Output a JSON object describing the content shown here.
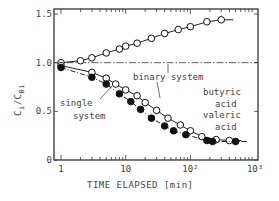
{
  "chart_data": {
    "type": "scatter",
    "title": "",
    "xlabel": "TIME ELAPSED  [min]",
    "ylabel": "C_i/C_0i",
    "xscale": "log",
    "xlim": [
      0.8,
      1000
    ],
    "ylim": [
      0,
      1.5
    ],
    "x_ticks": [
      "1",
      "10",
      "10²",
      "10³"
    ],
    "y_ticks": [
      "0",
      "0.5",
      "1.0",
      "1.5"
    ],
    "grid": false,
    "reference_line": {
      "y": 1.0,
      "style": "dash-dot",
      "label": "binary system"
    },
    "annotations": [
      "butyric acid",
      "binary system",
      "single system",
      "valeric acid"
    ],
    "series": [
      {
        "name": "butyric acid (binary system)",
        "marker": "open-circle",
        "x": [
          1,
          2,
          3,
          5,
          8,
          10,
          15,
          25,
          40,
          65,
          100,
          180,
          300
        ],
        "y": [
          1.0,
          1.02,
          1.05,
          1.1,
          1.14,
          1.17,
          1.2,
          1.25,
          1.3,
          1.34,
          1.37,
          1.42,
          1.44
        ]
      },
      {
        "name": "valeric acid (binary system)",
        "marker": "open-circle",
        "x": [
          1,
          3,
          5,
          7,
          10,
          15,
          20,
          30,
          45,
          70,
          100,
          150,
          250,
          400
        ],
        "y": [
          0.97,
          0.9,
          0.84,
          0.78,
          0.72,
          0.66,
          0.59,
          0.51,
          0.43,
          0.36,
          0.3,
          0.24,
          0.21,
          0.2
        ]
      },
      {
        "name": "valeric acid (single system)",
        "marker": "filled-circle",
        "x": [
          1,
          3,
          5,
          8,
          12,
          17,
          25,
          40,
          55,
          85,
          180,
          220,
          500
        ],
        "y": [
          0.95,
          0.85,
          0.78,
          0.68,
          0.6,
          0.52,
          0.43,
          0.35,
          0.3,
          0.26,
          0.2,
          0.19,
          0.19
        ]
      }
    ]
  },
  "labels": {
    "butyric": [
      "butyric",
      "acid"
    ],
    "binary": "binary system",
    "single": [
      "single",
      "system"
    ],
    "valeric": [
      "valeric",
      "acid"
    ],
    "xlabel": "TIME ELAPSED  [min]",
    "ylabel_main": "C",
    "ylabel_sub_i": "i",
    "ylabel_slash": "/C",
    "ylabel_sub_0i": "0i"
  }
}
